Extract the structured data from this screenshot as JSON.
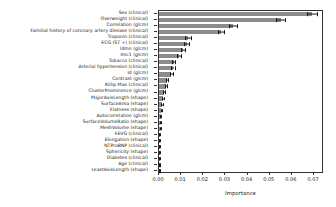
{
  "chart_data": {
    "type": "bar",
    "orientation": "horizontal",
    "title": "",
    "xlabel": "Importance",
    "ylabel": "",
    "xlim": [
      0.0,
      0.0745
    ],
    "xticks": [
      "0.00",
      "0.01",
      "0.02",
      "0.03",
      "0.04",
      "0.05",
      "0.06",
      "0.07"
    ],
    "xtick_values": [
      0.0,
      0.01,
      0.02,
      0.03,
      0.04,
      0.05,
      0.06,
      0.07
    ],
    "grid": false,
    "legend": null,
    "bar_color": "#8c8c8c",
    "errorbar_color": "#1a1a1a",
    "categories": [
      "Sex (clinical)",
      "Overweight (clinical)",
      "Correlation (glcm)",
      "Familial history of coronary artery disease (clinical)",
      "Troponin (clinical)",
      "ECG (ST +) (clinical)",
      "Idmn (glcm)",
      "Imc1 (glcm)",
      "Tobacco (clinical)",
      "Arterial hypertension (clinical)",
      "Id (glcm)",
      "Contrast (glcm)",
      "Killip Max (clinical)",
      "ClusterProminence (glcm)",
      "MajorAxisLength (shape)",
      "SurfaceArea (shape)",
      "Flatness (shape)",
      "Autocorrelation (glcm)",
      "SurfaceVolumeRatio (shape)",
      "MeshVolume (shape)",
      "FEVG (clinical)",
      "Elongation (shape)",
      "NTProBNP (clinical)",
      "Sphericity (shape)",
      "Diabetes (clinical)",
      "Age (clinical)",
      "LeastAxisLength (shape)"
    ],
    "values": [
      0.069,
      0.055,
      0.0332,
      0.028,
      0.0131,
      0.0125,
      0.0108,
      0.009,
      0.0066,
      0.0062,
      0.0055,
      0.0036,
      0.0032,
      0.0023,
      0.0017,
      0.0013,
      0.0011,
      0.0008,
      0.0006,
      0.0005,
      0.0003,
      0.0003,
      0.0002,
      0.0002,
      0.0001,
      0.0001,
      0.0
    ],
    "errors": [
      0.0022,
      0.002,
      0.0018,
      0.0015,
      0.0012,
      0.0011,
      0.001,
      0.0009,
      0.0008,
      0.0008,
      0.0007,
      0.0006,
      0.0005,
      0.0005,
      0.0004,
      0.0004,
      0.0003,
      0.0003,
      0.0003,
      0.0002,
      0.0002,
      0.0002,
      0.0002,
      0.0002,
      0.0001,
      0.0001,
      0.0001
    ]
  }
}
